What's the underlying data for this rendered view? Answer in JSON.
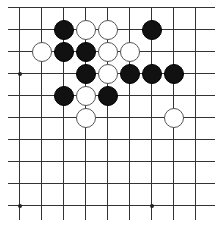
{
  "board": {
    "grid": {
      "xs": [
        19,
        41,
        63,
        85,
        107,
        129,
        151,
        173,
        195
      ],
      "ys": [
        7,
        29,
        51,
        73,
        95,
        117,
        139,
        161,
        183,
        205
      ],
      "line_color": "#333333",
      "top_edge": true
    },
    "star_points": [
      [
        19,
        73
      ],
      [
        19,
        205
      ],
      [
        151,
        205
      ]
    ],
    "stones": [
      {
        "color": "black",
        "col": 2,
        "row": 1
      },
      {
        "color": "white",
        "col": 3,
        "row": 1
      },
      {
        "color": "white",
        "col": 4,
        "row": 1
      },
      {
        "color": "black",
        "col": 6,
        "row": 1
      },
      {
        "color": "white",
        "col": 1,
        "row": 2
      },
      {
        "color": "black",
        "col": 2,
        "row": 2
      },
      {
        "color": "black",
        "col": 3,
        "row": 2
      },
      {
        "color": "white",
        "col": 4,
        "row": 2
      },
      {
        "color": "white",
        "col": 5,
        "row": 2
      },
      {
        "color": "black",
        "col": 3,
        "row": 3
      },
      {
        "color": "white",
        "col": 4,
        "row": 3
      },
      {
        "color": "black",
        "col": 5,
        "row": 3
      },
      {
        "color": "black",
        "col": 6,
        "row": 3
      },
      {
        "color": "black",
        "col": 7,
        "row": 3
      },
      {
        "color": "black",
        "col": 2,
        "row": 4
      },
      {
        "color": "white",
        "col": 3,
        "row": 4
      },
      {
        "color": "black",
        "col": 4,
        "row": 4
      },
      {
        "color": "white",
        "col": 3,
        "row": 5
      },
      {
        "color": "white",
        "col": 7,
        "row": 5
      }
    ]
  }
}
